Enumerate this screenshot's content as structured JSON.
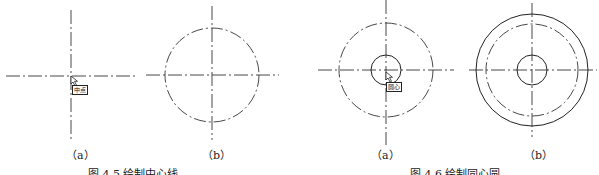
{
  "figures": [
    {
      "caption": "图 4.5  绘制中心线",
      "panels": [
        {
          "label": "（a）",
          "snap_tooltip": "中点",
          "elements": [
            "crosshair center lines",
            "cursor snap"
          ]
        },
        {
          "label": "（b）",
          "elements": [
            "crosshair center lines",
            "dash-dot circle"
          ]
        }
      ]
    },
    {
      "caption": "图 4.6  绘制同心圆",
      "panels": [
        {
          "label": "（a）",
          "snap_tooltip": "圆心",
          "elements": [
            "crosshair center lines",
            "dash-dot circle",
            "inner solid circle",
            "cursor snap"
          ]
        },
        {
          "label": "（b）",
          "elements": [
            "crosshair center lines",
            "outer solid circle",
            "dash-dot circle",
            "inner solid circle"
          ]
        }
      ]
    }
  ]
}
